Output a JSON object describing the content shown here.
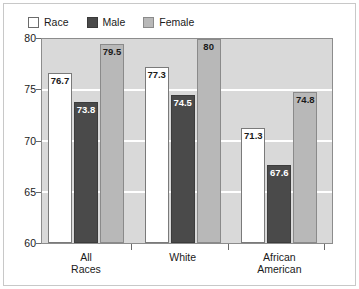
{
  "chart_data": {
    "type": "bar",
    "title": "",
    "xlabel": "",
    "ylabel": "",
    "ylim": [
      60,
      80
    ],
    "yticks": [
      60,
      65,
      70,
      75,
      80
    ],
    "ytick_labels": [
      "60",
      "65",
      "70",
      "75",
      "80"
    ],
    "gridlines": [
      65,
      70,
      75
    ],
    "grid": true,
    "legend_position": "top-left",
    "categories": [
      "All Races",
      "White",
      "African American"
    ],
    "category_lines": [
      [
        "All",
        "Races"
      ],
      [
        "White",
        ""
      ],
      [
        "African",
        "American"
      ]
    ],
    "series": [
      {
        "name": "Race",
        "color": "#ffffff",
        "values": [
          76.7,
          77.3,
          71.3
        ],
        "labels": [
          "76.7",
          "77.3",
          "71.3"
        ]
      },
      {
        "name": "Male",
        "color": "#4a4a4a",
        "values": [
          73.8,
          74.5,
          67.6
        ],
        "labels": [
          "73.8",
          "74.5",
          "67.6"
        ]
      },
      {
        "name": "Female",
        "color": "#b8b8b8",
        "values": [
          79.5,
          80,
          74.8
        ],
        "labels": [
          "79.5",
          "80",
          "74.8"
        ]
      }
    ]
  },
  "legend": {
    "items": [
      {
        "label": "Race",
        "swatch": "race-swatch"
      },
      {
        "label": "Male",
        "swatch": "male-swatch"
      },
      {
        "label": "Female",
        "swatch": "female-swatch"
      }
    ]
  },
  "axis": {
    "y_labels": [
      "80",
      "75",
      "70",
      "65",
      "60"
    ]
  },
  "colors": {
    "plot_background": "#d9d9d9",
    "gridline": "#ffffff",
    "race_bar": "#ffffff",
    "male_bar": "#4a4a4a",
    "female_bar": "#b8b8b8",
    "axis": "#8c8c8c",
    "text": "#1a1a1a"
  }
}
